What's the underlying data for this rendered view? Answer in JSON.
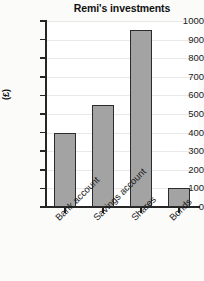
{
  "chart_data": {
    "type": "bar",
    "title": "Remi's investments",
    "xlabel": "",
    "ylabel": "(£)",
    "categories": [
      "Bank account",
      "Savings account",
      "Shares",
      "Bonds"
    ],
    "values": [
      400,
      550,
      950,
      100
    ],
    "ylim": [
      0,
      1000
    ],
    "ytick_labels": [
      "0",
      "100",
      "200",
      "300",
      "400",
      "500",
      "600",
      "700",
      "800",
      "900",
      "1000"
    ],
    "ytick_values": [
      0,
      100,
      200,
      300,
      400,
      500,
      600,
      700,
      800,
      900,
      1000
    ],
    "grid": true,
    "legend": false,
    "bar_color": "#a3a3a3",
    "bar_edge_color": "#2b2b2b",
    "axis_color": "#262626",
    "grid_color": "#e9e9e9",
    "background": "#ffffff"
  },
  "page": {
    "bottom_fragment": ""
  }
}
